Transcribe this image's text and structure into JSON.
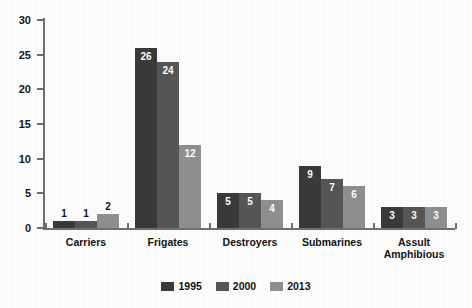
{
  "chart_data": {
    "type": "bar",
    "title": "",
    "subtitle": "",
    "xlabel": "",
    "ylabel": "",
    "ylim": [
      0,
      30
    ],
    "ytick_labels": [
      "30",
      "25",
      "20",
      "15",
      "10",
      "5",
      "0"
    ],
    "ytick_values": [
      30,
      25,
      20,
      15,
      10,
      5,
      0
    ],
    "grid": false,
    "legend_position": "bottom-center",
    "categories": [
      "Carriers",
      "Frigates",
      "Destroyers",
      "Submarines",
      "Assult Amphibious"
    ],
    "category_label_lines": [
      [
        "Carriers"
      ],
      [
        "Frigates"
      ],
      [
        "Destroyers"
      ],
      [
        "Submarines"
      ],
      [
        "Assult",
        "Amphibious"
      ]
    ],
    "series": [
      {
        "name": "1995",
        "color": "#3a3a3a",
        "values": [
          1,
          26,
          5,
          9,
          3
        ]
      },
      {
        "name": "2000",
        "color": "#565656",
        "values": [
          1,
          24,
          5,
          7,
          3
        ]
      },
      {
        "name": "2013",
        "color": "#8f8f8f",
        "values": [
          2,
          12,
          4,
          6,
          3
        ]
      }
    ]
  },
  "legend": {
    "items": [
      {
        "label": "1995",
        "color": "#3a3a3a"
      },
      {
        "label": "2000",
        "color": "#565656"
      },
      {
        "label": "2013",
        "color": "#8f8f8f"
      }
    ]
  },
  "axis": {
    "line_color": "#6f6f6f"
  }
}
